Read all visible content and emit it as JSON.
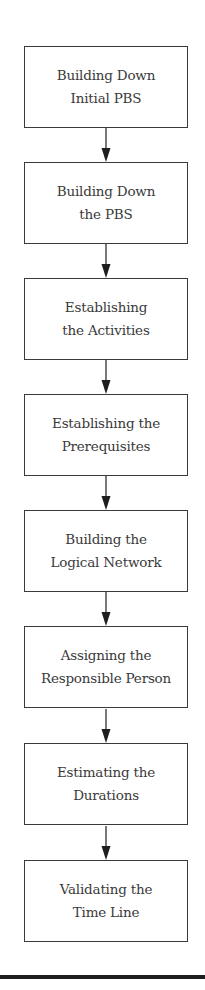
{
  "diagram": {
    "type": "vertical-flowchart",
    "steps": [
      {
        "line1": "Building Down",
        "line2": "Initial PBS"
      },
      {
        "line1": "Building Down",
        "line2": "the PBS"
      },
      {
        "line1": "Establishing",
        "line2": "the Activities"
      },
      {
        "line1": "Establishing the",
        "line2": "Prerequisites"
      },
      {
        "line1": "Building the",
        "line2": "Logical Network"
      },
      {
        "line1": "Assigning the",
        "line2": "Responsible Person"
      },
      {
        "line1": "Estimating the",
        "line2": "Durations"
      },
      {
        "line1": "Validating the",
        "line2": "Time Line"
      }
    ],
    "connectors": [
      {
        "from": 0,
        "to": 1
      },
      {
        "from": 1,
        "to": 2
      },
      {
        "from": 2,
        "to": 3
      },
      {
        "from": 3,
        "to": 4
      },
      {
        "from": 4,
        "to": 5
      },
      {
        "from": 5,
        "to": 6
      },
      {
        "from": 6,
        "to": 7
      }
    ],
    "colors": {
      "box_border": "#3a3a3a",
      "text": "#3a3a3a",
      "arrow": "#1e1e1e",
      "rule": "#1e1e1e"
    }
  }
}
